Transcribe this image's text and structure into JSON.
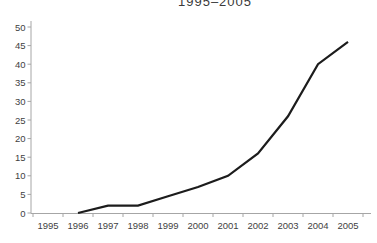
{
  "page": {
    "background_color": "#ffffff"
  },
  "chart_data": {
    "type": "line",
    "title": "1995–2005",
    "categories": [
      "1995",
      "1996",
      "1997",
      "1998",
      "1999",
      "2000",
      "2001",
      "2002",
      "2003",
      "2004",
      "2005"
    ],
    "values": [
      null,
      0,
      2,
      2,
      4.5,
      7,
      10,
      16,
      26,
      40,
      46
    ],
    "xlabel": "",
    "ylabel": "",
    "ylim": [
      0,
      50
    ],
    "yticks": [
      0,
      5,
      10,
      15,
      20,
      25,
      30,
      35,
      40,
      45,
      50
    ],
    "grid": false,
    "legend": "none",
    "line_color": "#1c1c1c",
    "axis_color": "#a6a6a6",
    "label_color": "#3f3f3f"
  }
}
